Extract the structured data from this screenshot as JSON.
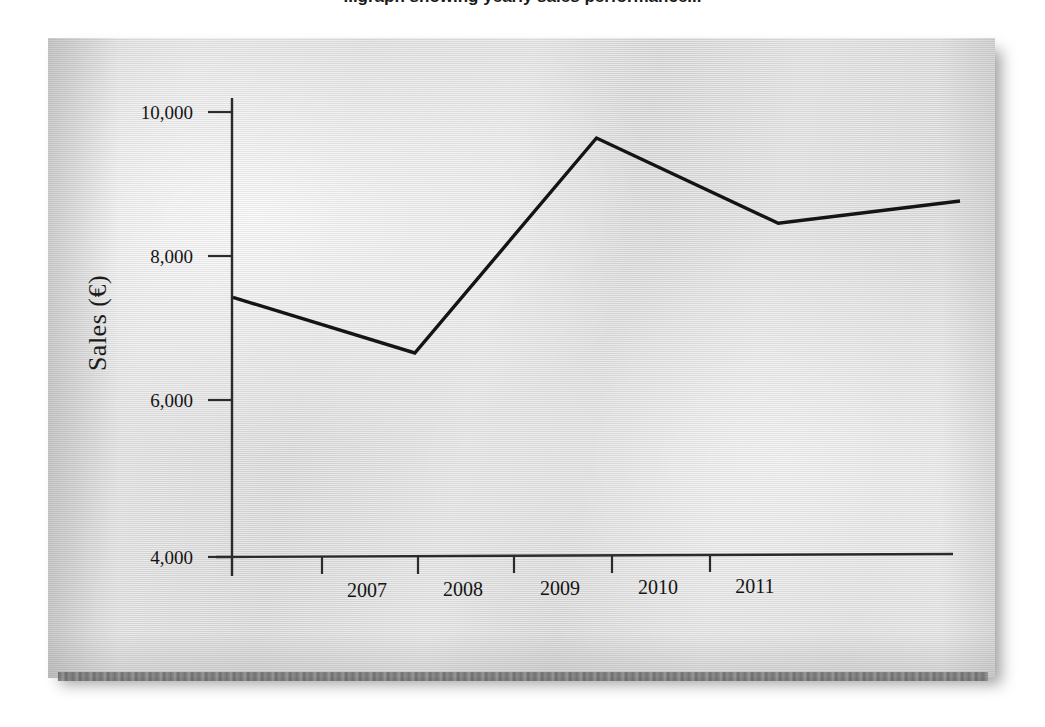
{
  "page": {
    "clipped_heading": "...graph showing yearly sales performance...",
    "background_color": "#ffffff",
    "paper_color": "#e0e0e0",
    "ink_color": "#141414"
  },
  "chart_data": {
    "type": "line",
    "title": "",
    "xlabel": "",
    "ylabel": "Sales (€)",
    "categories": [
      "2007",
      "2008",
      "2009",
      "2010",
      "2011"
    ],
    "x": [
      2007,
      2008,
      2009,
      2010,
      2011
    ],
    "values": [
      7500,
      6750,
      9650,
      8500,
      8800
    ],
    "series": [
      {
        "name": "Sales",
        "values": [
          7500,
          6750,
          9650,
          8500,
          8800
        ],
        "color": "#141414"
      }
    ],
    "ylim": [
      4000,
      10000
    ],
    "ytick_labels": [
      "10,000",
      "8,000",
      "6,000",
      "4,000"
    ],
    "ytick_values": [
      10000,
      8000,
      6000,
      4000
    ],
    "xtick_labels": [
      "2007",
      "2008",
      "2009",
      "2010",
      "2011"
    ],
    "grid": false,
    "legend": false,
    "legend_position": "none",
    "axis_color": "#2b2b2b",
    "line_color": "#141414",
    "line_width": 3
  }
}
